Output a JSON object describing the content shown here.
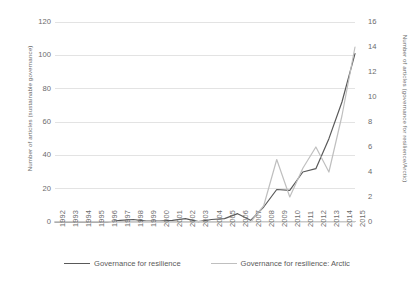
{
  "chart_data": {
    "type": "line",
    "title": "",
    "xlabel": "",
    "ylabel": "Number of articles (sustainable governance)",
    "y2label": "Number of articles (governance for resilience/Arctic)",
    "grid": true,
    "legend_position": "bottom",
    "ylim": [
      0,
      120
    ],
    "y2lim": [
      0,
      16
    ],
    "yticks": [
      0,
      20,
      40,
      60,
      80,
      100,
      120
    ],
    "y2ticks": [
      0,
      2,
      4,
      6,
      8,
      10,
      12,
      14,
      16
    ],
    "categories": [
      "1992",
      "1993",
      "1994",
      "1995",
      "1996",
      "1997",
      "1998",
      "1999",
      "2000",
      "2001",
      "2002",
      "2003",
      "2004",
      "2005",
      "2006",
      "2007",
      "2008",
      "2009",
      "2010",
      "2011",
      "2012",
      "2013",
      "2014",
      "2015"
    ],
    "series": [
      {
        "name": "Governance for resilience",
        "axis": "left",
        "color": "#595959",
        "values": [
          0,
          0,
          0,
          0,
          0,
          1,
          1.5,
          0.5,
          0.5,
          1,
          2,
          0.2,
          1.5,
          2,
          5,
          1,
          9,
          19.5,
          19,
          30,
          32,
          50,
          72,
          101
        ]
      },
      {
        "name": "Governance for resilience: Arctic",
        "axis": "right",
        "color": "#bfbfbf",
        "values": [
          0,
          0,
          0,
          0,
          0,
          0,
          0,
          0,
          0,
          0,
          0,
          0,
          0,
          0,
          0,
          0,
          1.3,
          5,
          2,
          4.3,
          6,
          4,
          8.5,
          14
        ]
      }
    ]
  },
  "legend": {
    "items": [
      {
        "label": "Governance for resilience",
        "color": "#595959"
      },
      {
        "label": "Governance for resilience: Arctic",
        "color": "#bfbfbf"
      }
    ]
  }
}
